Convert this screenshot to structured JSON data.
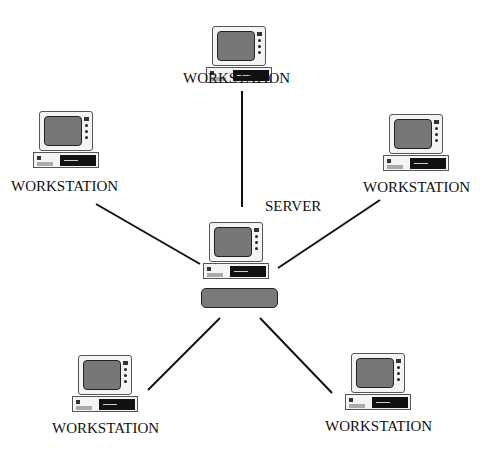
{
  "diagram": {
    "type": "star-network",
    "server": {
      "label": "SERVER"
    },
    "workstations": [
      {
        "id": "top",
        "label": "WORKSTATION"
      },
      {
        "id": "upper-left",
        "label": "WORKSTATION"
      },
      {
        "id": "upper-right",
        "label": "WORKSTATION"
      },
      {
        "id": "lower-left",
        "label": "WORKSTATION"
      },
      {
        "id": "lower-right",
        "label": "WORKSTATION"
      }
    ],
    "colors": {
      "line": "#111111",
      "screen": "#777777",
      "keyboard": "#7a7a7a"
    }
  }
}
